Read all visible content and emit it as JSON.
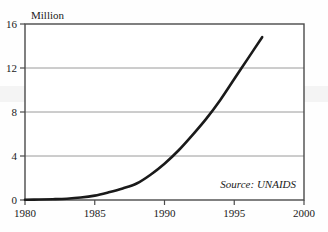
{
  "chart_data": {
    "type": "line",
    "title": "",
    "subtitle": "",
    "xlabel": "",
    "ylabel": "Million",
    "xlim": [
      1980,
      2000
    ],
    "ylim": [
      0,
      16
    ],
    "grid": true,
    "grid_axis": "y",
    "legend": false,
    "legend_position": "none",
    "annotations": [
      {
        "name": "source-note",
        "text": "Source: UNAIDS",
        "x": 1996.6,
        "y": 1.55,
        "align": "right",
        "style": "italic"
      }
    ],
    "x_ticks": [
      1980,
      1985,
      1990,
      1995,
      2000
    ],
    "x_tick_labels": [
      "1980",
      "1985",
      "1990",
      "1995",
      "2000"
    ],
    "y_ticks": [
      0,
      4,
      8,
      12,
      16
    ],
    "y_tick_labels": [
      "0",
      "4",
      "8",
      "12",
      "16"
    ],
    "series": [
      {
        "name": "cumulative-total",
        "color": "#1a1a1a",
        "line_width": 2.6,
        "x": [
          1980,
          1981,
          1982,
          1983,
          1984,
          1985,
          1986,
          1987,
          1988,
          1989,
          1990,
          1991,
          1992,
          1993,
          1994,
          1995,
          1996,
          1997
        ],
        "values": [
          0.02,
          0.04,
          0.07,
          0.12,
          0.22,
          0.4,
          0.7,
          1.05,
          1.5,
          2.3,
          3.3,
          4.5,
          5.9,
          7.4,
          9.1,
          11.0,
          12.9,
          14.8
        ]
      }
    ]
  },
  "axes": {
    "y_axis_label": "Million",
    "x_tick_1": "1980",
    "x_tick_2": "1985",
    "x_tick_3": "1990",
    "x_tick_4": "1995",
    "x_tick_5": "2000",
    "y_tick_1": "0",
    "y_tick_2": "4",
    "y_tick_3": "8",
    "y_tick_4": "12",
    "y_tick_5": "16"
  },
  "source": {
    "text": "Source: UNAIDS"
  },
  "colors": {
    "line": "#1a1a1a",
    "frame": "#4a4a4a",
    "grid": "#9a9a9a",
    "background": "#fefefe",
    "text": "#1a1a1a"
  }
}
